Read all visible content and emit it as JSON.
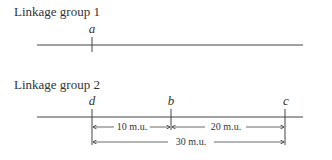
{
  "groups": [
    {
      "title": "Linkage group 1",
      "genes": [
        {
          "label": "a"
        }
      ]
    },
    {
      "title": "Linkage group 2",
      "genes": [
        {
          "label": "d"
        },
        {
          "label": "b"
        },
        {
          "label": "c"
        }
      ],
      "distances": [
        {
          "from": "d",
          "to": "b",
          "label": "10 m.u."
        },
        {
          "from": "b",
          "to": "c",
          "label": "20 m.u."
        },
        {
          "from": "d",
          "to": "c",
          "label": "30 m.u."
        }
      ]
    }
  ]
}
